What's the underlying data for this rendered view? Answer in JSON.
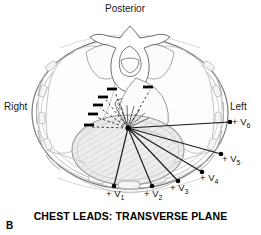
{
  "figure": {
    "panel_letter": "B",
    "caption": "CHEST LEADS: TRANSVERSE PLANE",
    "orientation_labels": {
      "posterior": "Posterior",
      "right": "Right",
      "left": "Left"
    },
    "colors": {
      "outline": "#8c8c8c",
      "vector": "#1a1a1a",
      "text": "#111111",
      "heart_fill": "#e8e8e8",
      "background": "#ffffff",
      "marker": "#000000"
    }
  },
  "diagram": {
    "type": "anatomical-cross-section",
    "plane": "transverse",
    "origin": {
      "label": "heart-electrical-center",
      "x": 128,
      "y": 128
    },
    "leads": [
      {
        "name": "V1",
        "sign": "+",
        "label_text": "V",
        "subscript": "1",
        "dot_x": 114,
        "dot_y": 186,
        "label_x": 106,
        "label_y": 188
      },
      {
        "name": "V2",
        "sign": "+",
        "label_text": "V",
        "subscript": "2",
        "dot_x": 152,
        "dot_y": 186,
        "label_x": 144,
        "label_y": 188
      },
      {
        "name": "V3",
        "sign": "+",
        "label_text": "V",
        "subscript": "3",
        "dot_x": 178,
        "dot_y": 181,
        "label_x": 170,
        "label_y": 182
      },
      {
        "name": "V4",
        "sign": "+",
        "label_text": "V",
        "subscript": "4",
        "dot_x": 202,
        "dot_y": 172,
        "label_x": 200,
        "label_y": 172
      },
      {
        "name": "V5",
        "sign": "+",
        "label_text": "V",
        "subscript": "5",
        "dot_x": 221,
        "dot_y": 154,
        "label_x": 222,
        "label_y": 153
      },
      {
        "name": "V6",
        "sign": "+",
        "label_text": "V",
        "subscript": "6",
        "dot_x": 230,
        "dot_y": 122,
        "label_x": 232,
        "label_y": 116
      }
    ],
    "negative_markers": [
      {
        "x": 112,
        "y": 89
      },
      {
        "x": 103,
        "y": 97
      },
      {
        "x": 98,
        "y": 105
      },
      {
        "x": 93,
        "y": 114
      },
      {
        "x": 89,
        "y": 125
      },
      {
        "x": 148,
        "y": 87
      }
    ],
    "structures": [
      {
        "name": "thorax-outline"
      },
      {
        "name": "vertebra"
      },
      {
        "name": "heart-shaded"
      },
      {
        "name": "descending-aorta"
      },
      {
        "name": "esophagus"
      },
      {
        "name": "ribs"
      },
      {
        "name": "sternum"
      },
      {
        "name": "lungs"
      }
    ]
  }
}
